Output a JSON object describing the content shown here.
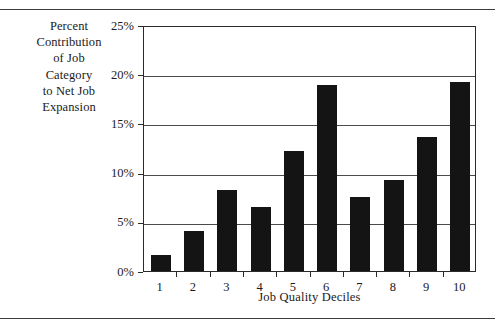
{
  "figure": {
    "y_axis_title_lines": [
      "Percent",
      "Contribution",
      "of Job",
      "Category",
      "to Net Job",
      "Expansion"
    ],
    "x_axis_title": "Job Quality Deciles",
    "axis_color": "#2b2b2b",
    "bar_color": "#141414",
    "gridline_color": "#4a4a4a",
    "background_color": "#ffffff"
  },
  "chart_data": {
    "type": "bar",
    "title": "",
    "subtitle": "",
    "xlabel": "Job Quality Deciles",
    "ylabel": "Percent Contribution of Job Category to Net Job Expansion",
    "categories": [
      "1",
      "2",
      "3",
      "4",
      "5",
      "6",
      "7",
      "8",
      "9",
      "10"
    ],
    "values": [
      1.6,
      4.1,
      8.2,
      6.5,
      12.2,
      18.9,
      7.5,
      9.2,
      13.6,
      19.2
    ],
    "value_unit": "%",
    "ylim": [
      0,
      25
    ],
    "ytick_values": [
      0,
      5,
      10,
      15,
      20,
      25
    ],
    "ytick_labels": [
      "0%",
      "5%",
      "10%",
      "15%",
      "20%",
      "25%"
    ],
    "grid": true,
    "grid_axis": "y",
    "legend": false,
    "legend_position": "none",
    "series": [
      {
        "name": "Percent Contribution of Job Category to Net Job Expansion",
        "values": [
          1.6,
          4.1,
          8.2,
          6.5,
          12.2,
          18.9,
          7.5,
          9.2,
          13.6,
          19.2
        ]
      }
    ]
  }
}
